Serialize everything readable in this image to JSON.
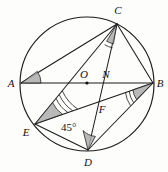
{
  "figure": {
    "type": "circle-geometry-diagram",
    "canvas": {
      "width": 168,
      "height": 172,
      "background": "#fdfdfc"
    },
    "circle": {
      "cx": 87,
      "cy": 84,
      "r": 67,
      "stroke": "#1b1b1b"
    },
    "points": [
      {
        "id": "A",
        "label": "A",
        "x": 21,
        "y": 83,
        "label_x": 11,
        "label_y": 87,
        "on_circle": true
      },
      {
        "id": "B",
        "label": "B",
        "x": 153,
        "y": 83,
        "label_x": 160,
        "label_y": 87,
        "on_circle": true
      },
      {
        "id": "C",
        "label": "C",
        "x": 117,
        "y": 24,
        "label_x": 118,
        "label_y": 14,
        "on_circle": true
      },
      {
        "id": "D",
        "label": "D",
        "x": 88,
        "y": 150,
        "label_x": 88,
        "label_y": 165,
        "on_circle": true
      },
      {
        "id": "E",
        "label": "E",
        "x": 35,
        "y": 124,
        "label_x": 26,
        "label_y": 135,
        "on_circle": true
      },
      {
        "id": "O",
        "label": "O",
        "x": 87,
        "y": 83,
        "label_x": 84,
        "label_y": 77,
        "on_circle": false,
        "is_center": true
      },
      {
        "id": "N",
        "label": "N",
        "x": 107,
        "y": 83,
        "label_x": 105,
        "label_y": 77,
        "on_circle": false
      },
      {
        "id": "F",
        "label": "F",
        "x": 99,
        "y": 104,
        "label_x": 101,
        "label_y": 112,
        "on_circle": false
      }
    ],
    "segments": [
      {
        "from": "A",
        "to": "B",
        "name": "diameter-AB"
      },
      {
        "from": "A",
        "to": "C",
        "name": "chord-AC"
      },
      {
        "from": "C",
        "to": "B",
        "name": "chord-CB"
      },
      {
        "from": "C",
        "to": "E",
        "name": "chord-CE"
      },
      {
        "from": "C",
        "to": "D",
        "name": "chord-CD"
      },
      {
        "from": "E",
        "to": "B",
        "name": "chord-EB"
      },
      {
        "from": "E",
        "to": "D",
        "name": "chord-ED"
      },
      {
        "from": "D",
        "to": "B",
        "name": "chord-DB"
      }
    ],
    "angle_markers": [
      {
        "id": "angle-A",
        "vertex": "A",
        "arcs": 0,
        "shaded": true,
        "name": "angle-marker-at-A"
      },
      {
        "id": "angle-C",
        "vertex": "C",
        "arcs": 1,
        "shaded": true,
        "name": "angle-marker-at-C"
      },
      {
        "id": "angle-B",
        "vertex": "B",
        "arcs": 2,
        "shaded": true,
        "name": "angle-marker-at-B"
      },
      {
        "id": "angle-E",
        "vertex": "E",
        "arcs": 3,
        "shaded": true,
        "name": "angle-marker-at-E"
      },
      {
        "id": "angle-D",
        "vertex": "D",
        "arcs": 0,
        "shaded": true,
        "name": "angle-marker-at-D"
      }
    ],
    "annotations": [
      {
        "id": "angle-45",
        "text": "45°",
        "x": 61,
        "y": 131,
        "name": "angle-label-45-degrees"
      }
    ]
  }
}
